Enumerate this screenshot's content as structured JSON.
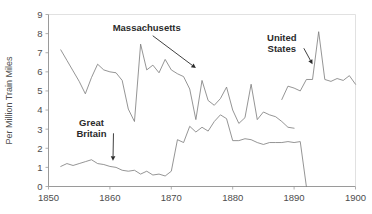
{
  "chart_data": {
    "type": "line",
    "title": "",
    "xlabel": "",
    "ylabel": "Per Million Train Miles",
    "xlim": [
      1850,
      1900
    ],
    "ylim": [
      0,
      9
    ],
    "xticks": [
      1850,
      1860,
      1870,
      1880,
      1890,
      1900
    ],
    "yticks": [
      0,
      1,
      2,
      3,
      4,
      5,
      6,
      7,
      8,
      9
    ],
    "xtick_labels": [
      "1850",
      "1860",
      "1870",
      "1880",
      "1890",
      "1900"
    ],
    "ytick_labels": [
      "0",
      "1",
      "2",
      "3",
      "4",
      "5",
      "6",
      "7",
      "8",
      "9"
    ],
    "grid": "top-only",
    "legend": "none",
    "annotations": [
      {
        "label": "Massachusetts",
        "text_x": 1866,
        "text_y": 8.15,
        "arrow_to_x": 1874,
        "arrow_to_y": 6.2
      },
      {
        "label": "United States",
        "text_line1": "United",
        "text_line2": "States",
        "text_x": 1888,
        "text_y": 7.6,
        "arrow_to_x": 1893,
        "arrow_to_y": 6.4
      },
      {
        "label": "Great Britain",
        "text_line1": "Great",
        "text_line2": "Britain",
        "text_x": 1857,
        "text_y": 3.15,
        "arrow_to_x": 1860.5,
        "arrow_to_y": 1.35
      }
    ],
    "series": [
      {
        "name": "Massachusetts",
        "color": "#7a7a7a",
        "x": [
          1852,
          1853,
          1854,
          1855,
          1856,
          1857,
          1858,
          1859,
          1860,
          1861,
          1862,
          1863,
          1864,
          1865,
          1866,
          1867,
          1868,
          1869,
          1870,
          1871,
          1872,
          1873,
          1874,
          1875,
          1876,
          1877,
          1878,
          1879,
          1880,
          1881,
          1882,
          1883,
          1884,
          1885,
          1886,
          1887,
          1888,
          1889,
          1890
        ],
        "values": [
          7.15,
          6.6,
          6.05,
          5.5,
          4.85,
          5.7,
          6.4,
          6.1,
          6.0,
          5.95,
          5.55,
          4.05,
          3.4,
          7.45,
          6.1,
          6.35,
          5.95,
          6.65,
          6.1,
          5.9,
          5.75,
          5.1,
          3.5,
          5.55,
          4.5,
          4.25,
          4.6,
          5.2,
          4.0,
          3.3,
          3.6,
          5.35,
          3.5,
          3.9,
          3.75,
          3.65,
          3.4,
          3.1,
          3.05
        ]
      },
      {
        "name": "United States",
        "color": "#7a7a7a",
        "x": [
          1888,
          1889,
          1890,
          1891,
          1892,
          1893,
          1894,
          1895,
          1896,
          1897,
          1898,
          1899,
          1900
        ],
        "values": [
          4.55,
          5.25,
          5.15,
          5.0,
          5.6,
          5.6,
          8.1,
          5.6,
          5.5,
          5.65,
          5.55,
          5.8,
          5.35
        ]
      },
      {
        "name": "Great Britain",
        "color": "#7a7a7a",
        "x": [
          1852,
          1853,
          1854,
          1855,
          1856,
          1857,
          1858,
          1859,
          1860,
          1861,
          1862,
          1863,
          1864,
          1865,
          1866,
          1867,
          1868,
          1869,
          1870,
          1871,
          1872,
          1873,
          1874,
          1875,
          1876,
          1877,
          1878,
          1879,
          1880,
          1881,
          1882,
          1883,
          1884,
          1885,
          1886,
          1887,
          1888,
          1889,
          1890,
          1891,
          1892
        ],
        "values": [
          1.05,
          1.2,
          1.1,
          1.2,
          1.3,
          1.4,
          1.2,
          1.15,
          1.05,
          1.0,
          0.85,
          0.8,
          0.85,
          0.65,
          0.8,
          0.6,
          0.65,
          0.55,
          0.8,
          2.45,
          2.3,
          3.15,
          2.85,
          3.1,
          2.9,
          3.4,
          3.75,
          3.55,
          2.4,
          2.4,
          2.5,
          2.45,
          2.3,
          2.2,
          2.3,
          2.3,
          2.3,
          2.35,
          2.3,
          2.35,
          0.0
        ]
      }
    ]
  }
}
